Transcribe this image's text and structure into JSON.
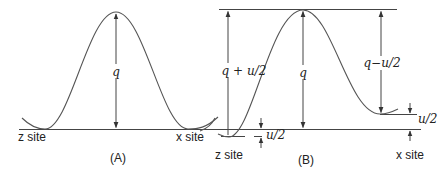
{
  "panel_a": {
    "label": "(A)",
    "barrier_label": "q",
    "left_site": "z site",
    "right_site": "x site"
  },
  "panel_b": {
    "label": "(B)",
    "barrier_label": "q",
    "left_barrier_label": "q + u/2",
    "right_barrier_label": "q−u/2",
    "lower_offset_label": "u/2",
    "upper_offset_label": "u/2",
    "left_site": "z site",
    "right_site": "x site"
  },
  "colors": {
    "line": "#444444",
    "curve": "#555555",
    "text": "#222222"
  }
}
